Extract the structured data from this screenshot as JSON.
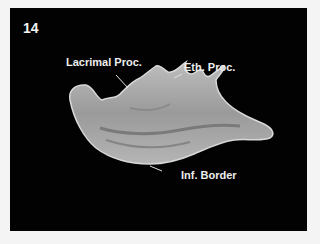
{
  "figure": {
    "number": "14",
    "background_color": "#020202",
    "labels": {
      "lacrimal": "Lacrimal Proc.",
      "ethmoidal": "Eth. Proc.",
      "inferior": "Inf. Border"
    }
  }
}
